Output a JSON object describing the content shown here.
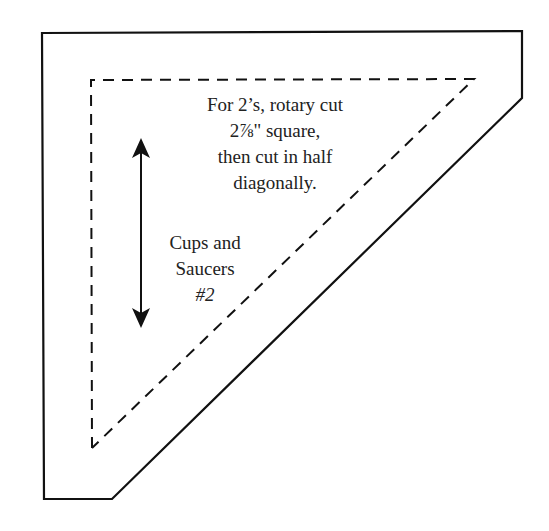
{
  "template": {
    "outer_outline_color": "#111111",
    "dashed_line_color": "#111111",
    "arrow_color": "#111111"
  },
  "instructions": {
    "lines": [
      "For 2’s, rotary cut",
      "2⅞\" square,",
      "then cut in half",
      "diagonally."
    ]
  },
  "label": {
    "lines": [
      "Cups and",
      "Saucers"
    ],
    "number": "#2"
  },
  "arrow": {
    "type": "double-headed vertical",
    "meaning": "grain line"
  }
}
